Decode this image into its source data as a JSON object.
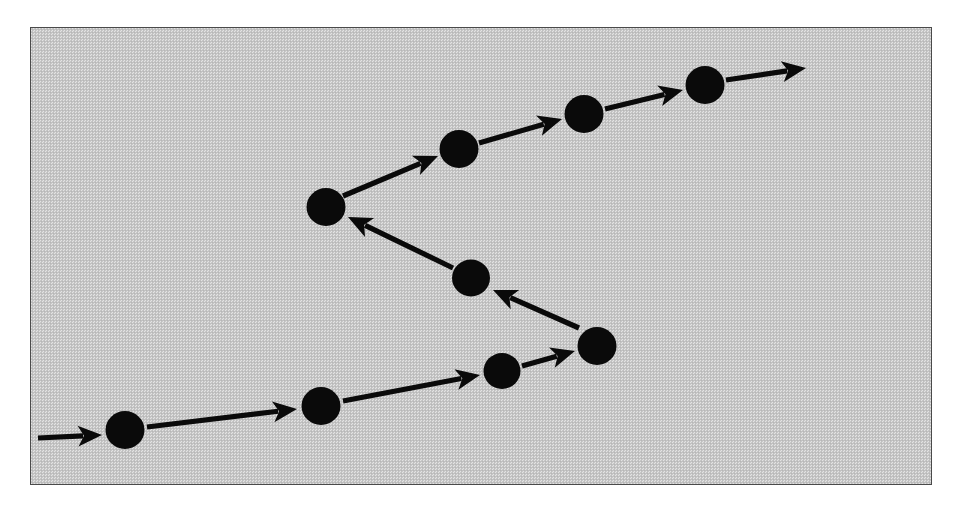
{
  "figure": {
    "kind": "node-and-arrow path diagram",
    "frame": {
      "x": 30,
      "y": 27,
      "width": 902,
      "height": 458,
      "border_color": "#4a4a4a",
      "fill_description": "dithered 50% gray halftone screen",
      "fill_color": "#c9c9c9"
    },
    "page_background": "#ffffff",
    "ink_color": "#0a0a0a"
  },
  "chart_data": {
    "type": "scatter",
    "xlabel": "",
    "ylabel": "",
    "xlim": [
      30,
      932
    ],
    "ylim": [
      27,
      485
    ],
    "grid": false,
    "legend": null,
    "node_radius": 19,
    "node_count": 9,
    "arrow_count": 10,
    "nodes": [
      {
        "id": "n1",
        "order": 1,
        "x": 124,
        "y": 429,
        "r": 19.5
      },
      {
        "id": "n2",
        "order": 2,
        "x": 320,
        "y": 405,
        "r": 19.5
      },
      {
        "id": "n3",
        "order": 3,
        "x": 501,
        "y": 370,
        "r": 18.5
      },
      {
        "id": "n4",
        "order": 4,
        "x": 596,
        "y": 345,
        "r": 19.5
      },
      {
        "id": "n5",
        "order": 5,
        "x": 470,
        "y": 277,
        "r": 19.0
      },
      {
        "id": "n6",
        "order": 6,
        "x": 325,
        "y": 206,
        "r": 19.5
      },
      {
        "id": "n7",
        "order": 7,
        "x": 458,
        "y": 148,
        "r": 19.5
      },
      {
        "id": "n8",
        "order": 8,
        "x": 583,
        "y": 113,
        "r": 19.5
      },
      {
        "id": "n9",
        "order": 9,
        "x": 704,
        "y": 84,
        "r": 19.5
      }
    ],
    "arrows": [
      {
        "id": "a0",
        "from": null,
        "to": "n1",
        "x1": 37,
        "y1": 437,
        "x2": 101,
        "y2": 434,
        "label": "entry arrow"
      },
      {
        "id": "a1",
        "from": "n1",
        "to": "n2",
        "x1": 146,
        "y1": 426,
        "x2": 296,
        "y2": 408,
        "label": "n1 to n2"
      },
      {
        "id": "a2",
        "from": "n2",
        "to": "n3",
        "x1": 342,
        "y1": 400,
        "x2": 479,
        "y2": 374,
        "label": "n2 to n3"
      },
      {
        "id": "a3",
        "from": "n3",
        "to": "n4",
        "x1": 521,
        "y1": 365,
        "x2": 574,
        "y2": 350,
        "label": "n3 to n4"
      },
      {
        "id": "a4",
        "from": "n4",
        "to": "n5",
        "x1": 578,
        "y1": 327,
        "x2": 492,
        "y2": 289,
        "label": "n4 to n5"
      },
      {
        "id": "a5",
        "from": "n5",
        "to": "n6",
        "x1": 452,
        "y1": 267,
        "x2": 347,
        "y2": 216,
        "label": "n5 to n6"
      },
      {
        "id": "a6",
        "from": "n6",
        "to": "n7",
        "x1": 342,
        "y1": 195,
        "x2": 437,
        "y2": 155,
        "label": "n6 to n7"
      },
      {
        "id": "a7",
        "from": "n7",
        "to": "n8",
        "x1": 478,
        "y1": 142,
        "x2": 561,
        "y2": 118,
        "label": "n7 to n8"
      },
      {
        "id": "a8",
        "from": "n8",
        "to": "n9",
        "x1": 604,
        "y1": 108,
        "x2": 682,
        "y2": 89,
        "label": "n8 to n9"
      },
      {
        "id": "a9",
        "from": "n9",
        "to": null,
        "x1": 725,
        "y1": 79,
        "x2": 805,
        "y2": 67,
        "label": "exit arrow"
      }
    ]
  }
}
